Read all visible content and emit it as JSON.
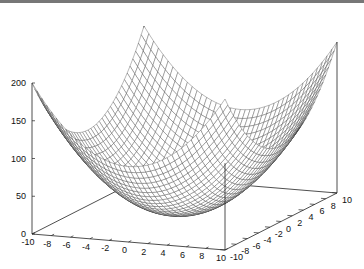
{
  "chart_data": {
    "type": "surface",
    "title": "",
    "function": "z = x^2 + y^2",
    "x": {
      "range": [
        -10,
        10
      ],
      "ticks": [
        -10,
        -8,
        -6,
        -4,
        -2,
        0,
        2,
        4,
        6,
        8,
        10
      ],
      "label": ""
    },
    "y": {
      "range": [
        -10,
        10
      ],
      "ticks": [
        -10,
        -8,
        -6,
        -4,
        -2,
        0,
        2,
        4,
        6,
        8,
        10
      ],
      "label": ""
    },
    "z": {
      "range": [
        0,
        200
      ],
      "ticks": [
        0,
        50,
        100,
        150,
        200
      ],
      "label": ""
    },
    "grid_resolution": 41,
    "z_min": 0,
    "z_max": 200,
    "corner_values": {
      "(-10,-10)": 200,
      "(10,-10)": 200,
      "(-10,10)": 200,
      "(10,10)": 200,
      "(0,0)": 0
    },
    "style": {
      "mesh_color": "#333333",
      "face_color": "#ffffff",
      "axis_color": "#222222"
    },
    "grid": false,
    "legend": null
  }
}
